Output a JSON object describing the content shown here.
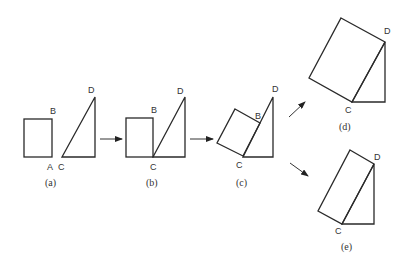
{
  "diagram": {
    "colors": {
      "stroke": "#2a2a2a",
      "background": "#ffffff"
    },
    "panels": [
      {
        "id": "a",
        "caption": "(a)",
        "vertex_labels": {
          "B": "B",
          "A": "A",
          "C": "C",
          "D": "D"
        }
      },
      {
        "id": "b",
        "caption": "(b)",
        "vertex_labels": {
          "B": "B",
          "C": "C",
          "D": "D"
        }
      },
      {
        "id": "c",
        "caption": "(c)",
        "vertex_labels": {
          "B": "B",
          "C": "C",
          "D": "D"
        }
      },
      {
        "id": "d",
        "caption": "(d)",
        "vertex_labels": {
          "C": "C",
          "D": "D"
        }
      },
      {
        "id": "e",
        "caption": "(e)",
        "vertex_labels": {
          "C": "C",
          "D": "D"
        }
      }
    ],
    "arrows": [
      {
        "from": "a",
        "to": "b"
      },
      {
        "from": "b",
        "to": "c"
      },
      {
        "from": "c",
        "to": "d"
      },
      {
        "from": "c",
        "to": "e"
      }
    ]
  }
}
